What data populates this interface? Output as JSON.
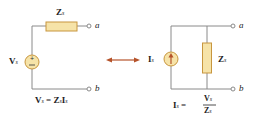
{
  "left_circuit": {
    "impedance_label": "Z",
    "impedance_sub": "s",
    "source_label": "V",
    "source_sub": "s",
    "terminal_a": "a",
    "terminal_b": "b",
    "equation": {
      "lhs": "V",
      "lhs_sub": "s",
      "eq": " = ",
      "rhs1": "Z",
      "rhs1_sub": "s",
      "rhs2": "I",
      "rhs2_sub": "s"
    }
  },
  "arrow": "double-arrow-icon",
  "right_circuit": {
    "source_label": "I",
    "source_sub": "s",
    "impedance_label": "Z",
    "impedance_sub": "s",
    "terminal_a": "a",
    "terminal_b": "b",
    "equation": {
      "lhs": "I",
      "lhs_sub": "s",
      "eq": " = ",
      "num": "V",
      "num_sub": "s",
      "den": "Z",
      "den_sub": "s"
    }
  },
  "colors": {
    "wire": "#888888",
    "component_fill": "#f6e3a8",
    "component_stroke": "#c8963e",
    "arrow": "#b5532a"
  }
}
